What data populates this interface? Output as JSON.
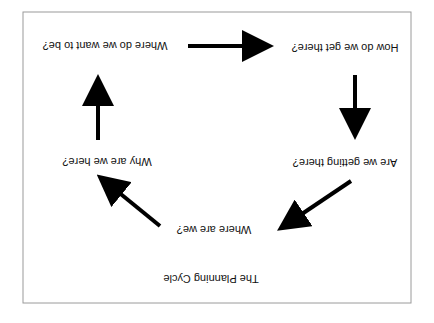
{
  "diagram": {
    "title": "The Planning Cycle",
    "orientation": "rotated 180 degrees",
    "nodes": [
      {
        "id": "where_now",
        "label": "Where are we?"
      },
      {
        "id": "why_here",
        "label": "Why are we here?"
      },
      {
        "id": "where_want",
        "label": "Where do we want to be?"
      },
      {
        "id": "how_get",
        "label": "How do we get there?"
      },
      {
        "id": "are_getting",
        "label": "Are we getting there?"
      }
    ],
    "edges": [
      {
        "from": "where_now",
        "to": "why_here"
      },
      {
        "from": "why_here",
        "to": "where_want"
      },
      {
        "from": "where_want",
        "to": "how_get"
      },
      {
        "from": "how_get",
        "to": "are_getting"
      },
      {
        "from": "are_getting",
        "to": "where_now"
      }
    ],
    "colors": {
      "arrow": "#000000",
      "text": "#111111",
      "frame": "#9a9a9a",
      "background": "#ffffff"
    }
  }
}
